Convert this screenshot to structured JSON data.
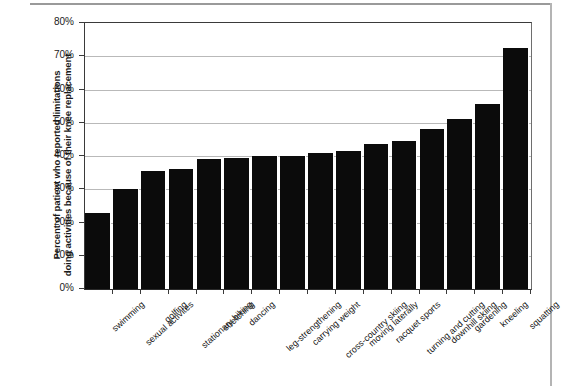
{
  "chart_data": {
    "type": "bar",
    "title": "",
    "subtitle": "",
    "xlabel": "",
    "ylabel": "Percent of patient who reported limitations doing activities because of their knee replacement",
    "ylabel_lines": [
      "Percent of patient who reported limitations",
      "doing activities because of their knee replacement"
    ],
    "ylim": [
      0,
      80
    ],
    "ytick_values": [
      0,
      10,
      20,
      30,
      40,
      50,
      60,
      70,
      80
    ],
    "ytick_labels": [
      "0%",
      "10%",
      "20%",
      "30%",
      "40%",
      "50%",
      "60%",
      "70%",
      "80%"
    ],
    "grid": true,
    "grid_axis": "y",
    "legend": false,
    "legend_position": "none",
    "bar_color": "#0b0b0b",
    "categories": [
      "swimming",
      "sexual activites",
      "golfing",
      "stationary biking",
      "stretching",
      "dancing",
      "leg-strengthening",
      "carrying weight",
      "cross-country skiing",
      "moving laterally",
      "racquet sports",
      "turning and cutting",
      "downhill skiing",
      "gardening",
      "kneeling",
      "squatting"
    ],
    "values": [
      23,
      30,
      35.5,
      36,
      39,
      39.5,
      40,
      40,
      41,
      41.5,
      43.5,
      44.5,
      48,
      51,
      55.5,
      72.5
    ],
    "series": [
      {
        "name": "Percent reporting limitation",
        "values": [
          23,
          30,
          35.5,
          36,
          39,
          39.5,
          40,
          40,
          41,
          41.5,
          43.5,
          44.5,
          48,
          51,
          55.5,
          72.5
        ]
      }
    ],
    "annotations": []
  },
  "colors": {
    "bar": "#0b0b0b",
    "grid": "#b9b9b9",
    "axis": "#3a3a3a",
    "text": "#111111",
    "background": "#ffffff"
  }
}
